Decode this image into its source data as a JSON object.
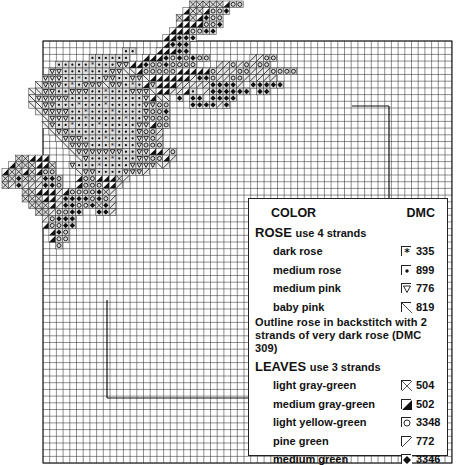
{
  "grid": {
    "x0": 43,
    "y0": 41,
    "x1": 452,
    "y1": 463,
    "cell": 6.7,
    "line_color": "#333333",
    "inner_lines": [
      {
        "x1": 352,
        "y1": 106,
        "x2": 389,
        "y2": 106
      },
      {
        "x1": 389,
        "y1": 106,
        "x2": 389,
        "y2": 200
      },
      {
        "x1": 107,
        "y1": 300,
        "x2": 107,
        "y2": 398
      },
      {
        "x1": 107,
        "y1": 398,
        "x2": 250,
        "y2": 398
      }
    ]
  },
  "legend": {
    "header": {
      "color_label": "COLOR",
      "dmc_label": "DMC"
    },
    "rose": {
      "title": "ROSE",
      "strands": "use 4 strands",
      "items": [
        {
          "name": "dark rose",
          "symbol": "star-box",
          "code": "335"
        },
        {
          "name": "medium rose",
          "symbol": "filled-dot",
          "code": "899"
        },
        {
          "name": "medium pink",
          "symbol": "triangle-down",
          "code": "776"
        },
        {
          "name": "baby pink",
          "symbol": "backslash",
          "code": "819"
        }
      ]
    },
    "note": "Outline rose in backstitch with 2 strands of very dark rose (DMC 309)",
    "leaves": {
      "title": "LEAVES",
      "strands": "use 3 strands",
      "items": [
        {
          "name": "light gray-green",
          "symbol": "x-cross",
          "code": "504"
        },
        {
          "name": "medium gray-green",
          "symbol": "half-black",
          "code": "502"
        },
        {
          "name": "light yellow-green",
          "symbol": "circle",
          "code": "3348"
        },
        {
          "name": "pine green",
          "symbol": "slash",
          "code": "772"
        },
        {
          "name": "medium green",
          "symbol": "diamond-black",
          "code": "3346"
        }
      ]
    }
  },
  "pattern": {
    "origin_x": 2,
    "origin_y": 1,
    "legend_codes": {
      "*": "335",
      "d": "899",
      "v": "776",
      "\\": "819",
      "x": "504",
      "h": "502",
      "o": "3348",
      "/": "772",
      "+": "3346"
    },
    "rows": [
      "                            xxxxxhoo",
      "                           hxxhoo+",
      "                          xhxh+oo",
      "                          hhhhoo+",
      "                         hhhoo++",
      "                        hh+++",
      "                        h+++",
      "                  dd   hhh++",
      "             dddddd  hhh+o+o+oo      //oo",
      "        ddddd*dddvvhh+oo+oooo   //o/o/oo",
      "       vvddd*dddvv\\\\hooooohhhhho///oo///oooo",
      "      vvvdd*dddvvddvv\\hhhhhh/++o//oo/////",
      "     \\vvvd*dvvv\\vvd*dhvhhh/////++++/ +++++",
      "    \\\\vvddvvvdd*dddvvv\\hh//hd /++++++ ++",
      "    \\vvvvvddddd*dddddvh\\\\ + ++ ++++",
      "    \\\\vvddd*ddd*dddddvvoo   ++++/+",
      "     \\vvvvdd*ddd*ddddvoo+",
      "      \\vvvdd*ddddd*ddvooo",
      "      \\vdd*ddd*dddddvvhoo",
      "       \\vvdddddd*dddvoo/",
      "        \\vvvddd*ddddvvo/",
      "         \\vvvddd*dddvooo",
      "          \\vvvvvvvddvvhh/o",
      "  xxhhh    \\vddd*dddvvooh/",
      " hxxxhhx  vddd*ddddvvvv\\/",
      "hxxhxhoo   \\vvddddvvv/",
      "xx+xx/++o  hoohhhx/",
      "x/+///++o  hooohh/",
      "   xxhhh/hoooo+x/",
      "   xxxhh/++++o+o/",
      "    xxxh/++oo+x+/",
      "     xx/oo++  ++/",
      "      /o+++",
      "      hoo++",
      "       h+o",
      "       hoo",
      "        o"
    ]
  }
}
